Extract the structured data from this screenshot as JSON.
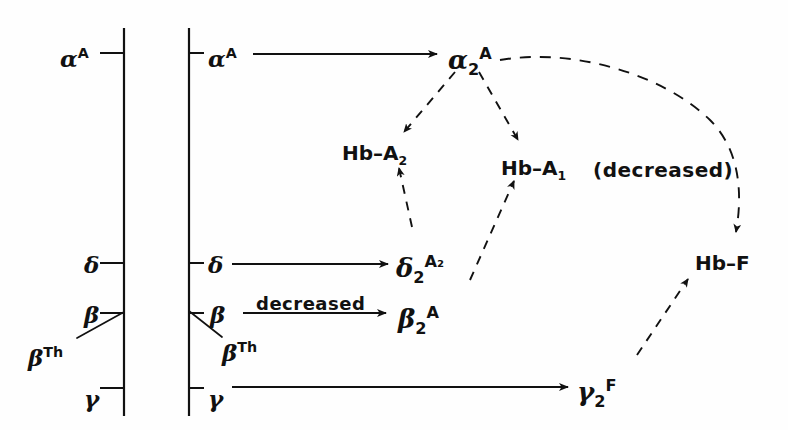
{
  "figure": {
    "kind": "hemoglobin-synthesis-pathway-diagram",
    "background_color": "#fefefe",
    "ink_color": "#111111"
  },
  "chromosome_bars": [
    {
      "name": "left-bar",
      "x": 124,
      "y_top": 28,
      "y_bottom": 416
    },
    {
      "name": "right-bar",
      "x": 189,
      "y_top": 28,
      "y_bottom": 416
    }
  ],
  "left_locus_labels": [
    {
      "id": "alpha-A",
      "base": "α",
      "sup": "A",
      "sub": "",
      "x": 60,
      "y": 46
    },
    {
      "id": "delta",
      "base": "δ",
      "sup": "",
      "sub": "",
      "x": 84,
      "y": 253
    },
    {
      "id": "beta",
      "base": "β",
      "sup": "",
      "sub": "",
      "x": 84,
      "y": 303
    },
    {
      "id": "beta-Th",
      "base": "β",
      "sup": "Th",
      "sub": "",
      "x": 28,
      "y": 345
    },
    {
      "id": "gamma",
      "base": "γ",
      "sup": "",
      "sub": "",
      "x": 84,
      "y": 387
    }
  ],
  "right_locus_labels": [
    {
      "id": "alpha-A",
      "base": "α",
      "sup": "A",
      "sub": "",
      "x": 208,
      "y": 46
    },
    {
      "id": "delta",
      "base": "δ",
      "sup": "",
      "sub": "",
      "x": 208,
      "y": 253
    },
    {
      "id": "beta",
      "base": "β",
      "sup": "",
      "sub": "",
      "x": 210,
      "y": 303
    },
    {
      "id": "beta-Th",
      "base": "β",
      "sup": "Th",
      "sub": "",
      "x": 222,
      "y": 340
    },
    {
      "id": "gamma",
      "base": "γ",
      "sup": "",
      "sub": "",
      "x": 208,
      "y": 387
    }
  ],
  "chain_nodes": [
    {
      "id": "alpha2-A",
      "base": "α",
      "sub": "2",
      "sup": "A",
      "x": 448,
      "y": 46
    },
    {
      "id": "delta2-A2",
      "base": "δ",
      "sub": "2",
      "sup": "A₂",
      "x": 396,
      "y": 254
    },
    {
      "id": "beta2-A",
      "base": "β",
      "sub": "2",
      "sup": "A",
      "x": 398,
      "y": 305
    },
    {
      "id": "gamma2-F",
      "base": "γ",
      "sub": "2",
      "sup": "F",
      "x": 577,
      "y": 378
    }
  ],
  "product_nodes": [
    {
      "id": "hb-A2",
      "text": "Hb–A",
      "sub": "2",
      "suffix": "",
      "x": 342,
      "y": 143
    },
    {
      "id": "hb-A1",
      "text": "Hb–A",
      "sub": "1",
      "suffix": "",
      "x": 501,
      "y": 158
    },
    {
      "id": "hb-F",
      "text": "Hb–F",
      "sub": "",
      "suffix": "",
      "x": 695,
      "y": 253
    }
  ],
  "annotations": [
    {
      "id": "hb-A1-status",
      "text": "(decreased)",
      "x": 593,
      "y": 158
    },
    {
      "id": "beta-transcription-rate",
      "text": "decreased",
      "x": 256,
      "y": 293
    }
  ],
  "solid_arrows": [
    {
      "id": "alpha-to-alpha2",
      "x1": 253,
      "y1": 54,
      "x2": 437,
      "y2": 54
    },
    {
      "id": "delta-to-delta2",
      "x1": 232,
      "y1": 264,
      "x2": 388,
      "y2": 264
    },
    {
      "id": "beta-to-beta2",
      "x1": 243,
      "y1": 313,
      "x2": 386,
      "y2": 313
    },
    {
      "id": "gamma-to-gamma2",
      "x1": 232,
      "y1": 387,
      "x2": 568,
      "y2": 387
    }
  ],
  "dashed_arrows": [
    {
      "id": "alpha2-to-hbA2",
      "x1": 455,
      "y1": 72,
      "x2": 404,
      "y2": 132
    },
    {
      "id": "alpha2-to-hbA1",
      "x1": 479,
      "y1": 72,
      "x2": 518,
      "y2": 140
    },
    {
      "id": "delta2-to-hbA2",
      "x1": 412,
      "y1": 227,
      "x2": 399,
      "y2": 168
    },
    {
      "id": "beta2-to-hbA1",
      "x1": 470,
      "y1": 280,
      "x2": 514,
      "y2": 181
    },
    {
      "id": "gamma2-to-hbF",
      "x1": 637,
      "y1": 355,
      "x2": 688,
      "y2": 279
    }
  ],
  "curved_dashed_arrow": {
    "id": "alpha2-to-hbF",
    "path": "M 500,60 C 570,48 660,72 710,120 C 742,152 742,198 736,232"
  },
  "locus_ticks": {
    "left": [
      {
        "id": "tick-alpha",
        "y": 53,
        "x_from": 100,
        "x_to": 124
      },
      {
        "id": "tick-delta",
        "y": 263,
        "x_from": 100,
        "x_to": 124
      },
      {
        "id": "tick-beta",
        "y": 313,
        "x_from": 100,
        "x_to": 124
      },
      {
        "id": "tick-gamma",
        "y": 388,
        "x_from": 100,
        "x_to": 124
      }
    ],
    "right": [
      {
        "id": "tick-alpha",
        "y": 53,
        "x_from": 189,
        "x_to": 204
      },
      {
        "id": "tick-delta",
        "y": 263,
        "x_from": 189,
        "x_to": 204
      },
      {
        "id": "tick-beta",
        "y": 313,
        "x_from": 189,
        "x_to": 204
      },
      {
        "id": "tick-gamma",
        "y": 388,
        "x_from": 189,
        "x_to": 204
      }
    ]
  },
  "pointer_lines": [
    {
      "id": "left-betaTh-pointer",
      "x1": 77,
      "y1": 338,
      "x2": 124,
      "y2": 312
    },
    {
      "id": "right-betaTh-pointer",
      "x1": 222,
      "y1": 337,
      "x2": 189,
      "y2": 311
    }
  ]
}
